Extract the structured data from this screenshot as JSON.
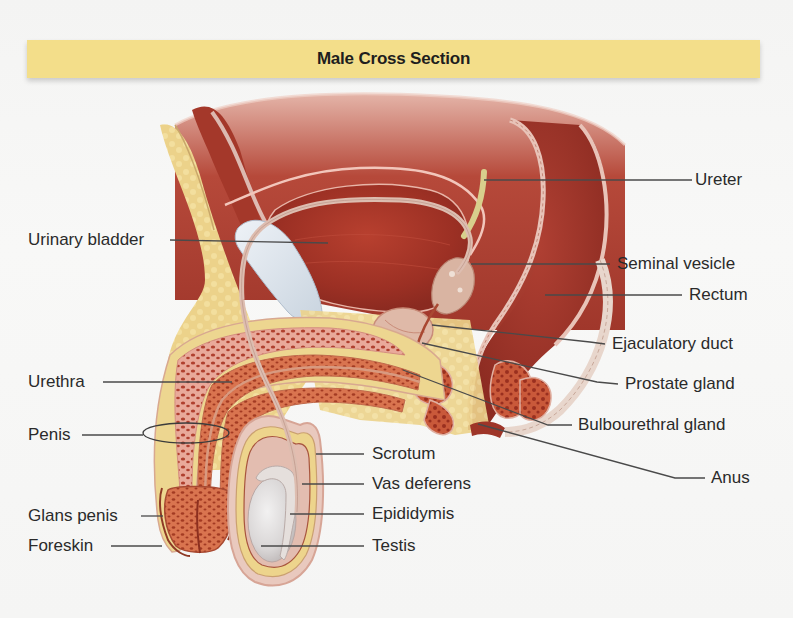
{
  "header": {
    "title": "Male Cross Section"
  },
  "colors": {
    "banner": "#f3de8a",
    "label_text": "#2a2a2a",
    "leader_line": "#4a4a4a",
    "muscle": "#a9372a",
    "fat": "#ecd58a",
    "tissue_pink": "#e9b8ab",
    "testis": "#dedcdc"
  },
  "labels": {
    "left": [
      {
        "id": "urinary-bladder",
        "text": "Urinary bladder"
      },
      {
        "id": "urethra",
        "text": "Urethra"
      },
      {
        "id": "penis",
        "text": "Penis"
      },
      {
        "id": "glans-penis",
        "text": "Glans penis"
      },
      {
        "id": "foreskin",
        "text": "Foreskin"
      }
    ],
    "right": [
      {
        "id": "ureter",
        "text": "Ureter"
      },
      {
        "id": "seminal-vesicle",
        "text": "Seminal vesicle"
      },
      {
        "id": "rectum",
        "text": "Rectum"
      },
      {
        "id": "ejaculatory-duct",
        "text": "Ejaculatory duct"
      },
      {
        "id": "prostate-gland",
        "text": "Prostate gland"
      },
      {
        "id": "bulbourethral-gland",
        "text": "Bulbourethral gland"
      },
      {
        "id": "anus",
        "text": "Anus"
      }
    ],
    "center": [
      {
        "id": "scrotum",
        "text": "Scrotum"
      },
      {
        "id": "vas-deferens",
        "text": "Vas deferens"
      },
      {
        "id": "epididymis",
        "text": "Epididymis"
      },
      {
        "id": "testis",
        "text": "Testis"
      }
    ]
  }
}
